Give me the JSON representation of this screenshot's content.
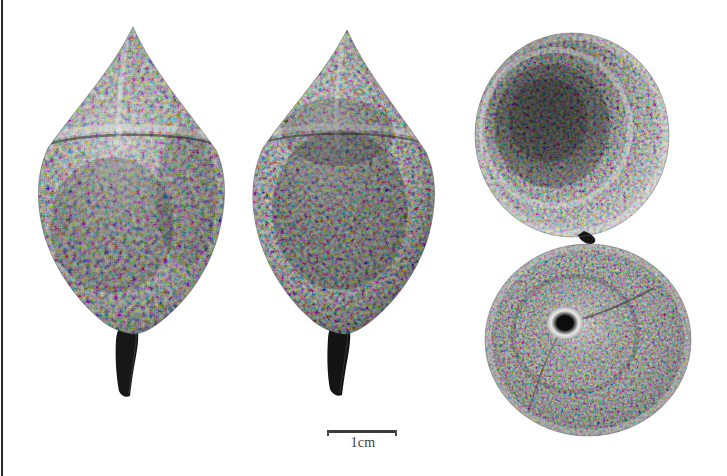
{
  "plate": {
    "title": "Fruit specimen plate",
    "description": "Four grayscale photographic views of a warty ovoid fruit with persistent stalk",
    "background_color": "#ffffff",
    "width": 727,
    "height": 476,
    "border_color": "#2a2a2a"
  },
  "scale_bar": {
    "label": "1cm",
    "length_px": 70,
    "line_color": "#3b3b3b",
    "tick_color": "#4a4a4a",
    "text_color": "#3d3d3d"
  },
  "specimens": [
    {
      "name": "lateral-view-left",
      "orientation": "lateral",
      "cx": 130,
      "cy": 205,
      "half_width": 92,
      "top_y": 27,
      "base_y": 330,
      "stalk_tip_y": 400,
      "stalk_color": "#171717",
      "tone_light": "#d8d8d8",
      "tone_mid": "#8d8d8d",
      "tone_dark": "#3e3e3e"
    },
    {
      "name": "lateral-view-middle",
      "orientation": "lateral",
      "cx": 345,
      "cy": 202,
      "half_width": 88,
      "top_y": 30,
      "base_y": 330,
      "stalk_tip_y": 398,
      "stalk_color": "#141414",
      "tone_light": "#d2d2d2",
      "tone_mid": "#868686",
      "tone_dark": "#353535"
    },
    {
      "name": "apical-view-upper-right",
      "orientation": "apical",
      "cx": 572,
      "cy": 135,
      "rx": 97,
      "ry": 102,
      "tone_light": "#d9d9d9",
      "tone_mid": "#8a8a8a",
      "tone_dark": "#3a3a3a"
    },
    {
      "name": "basal-view-lower-right",
      "orientation": "basal",
      "cx": 588,
      "cy": 340,
      "rx": 103,
      "ry": 96,
      "hilum_x": 565,
      "hilum_y": 323,
      "hilum_radius": 8,
      "hilum_color": "#0d0d0d",
      "hilum_halo_color": "#e2e2e2",
      "tone_light": "#dcdcdc",
      "tone_mid": "#909090",
      "tone_dark": "#3c3c3c"
    }
  ]
}
